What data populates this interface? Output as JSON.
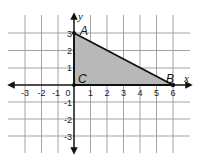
{
  "diagram": {
    "type": "coordinate-plane",
    "axes": {
      "x_label": "x",
      "y_label": "y"
    },
    "x_range": [
      -3,
      6
    ],
    "y_range": [
      -3,
      3
    ],
    "x_ticks": [
      "-3",
      "-2",
      "-1",
      "0",
      "1",
      "2",
      "3",
      "4",
      "5",
      "6"
    ],
    "y_ticks": [
      "3",
      "2",
      "1",
      "-1",
      "-2",
      "-3"
    ],
    "points": [
      {
        "label": "A",
        "x": 0,
        "y": 3
      },
      {
        "label": "B",
        "x": 6,
        "y": 0
      },
      {
        "label": "C",
        "x": 0,
        "y": 0
      }
    ],
    "shape": {
      "name": "triangle ABC",
      "vertices": [
        "A",
        "B",
        "C"
      ],
      "fill": "#b8b8b8",
      "stroke": "#111111"
    },
    "colors": {
      "grid": "#9a9a9a",
      "axis": "#111111",
      "fill": "#b8b8b8"
    }
  }
}
